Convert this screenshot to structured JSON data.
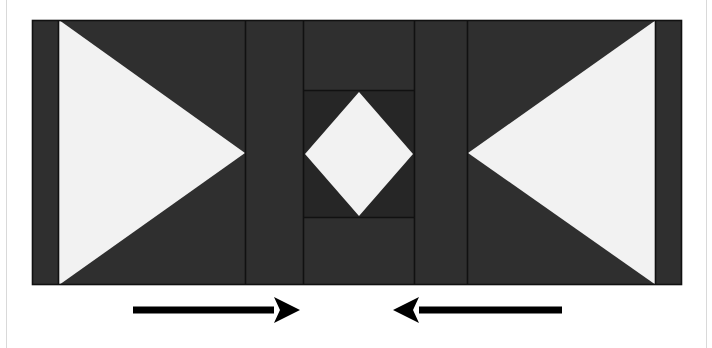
{
  "document": {
    "title": "Pieced Quilt Block Assembly Diagram",
    "description": "Horizontal pieced block: two large white triangles pointing inward flank a central square-in-a-square diamond unit, with two directional assembly arrows beneath."
  },
  "canvas": {
    "width": 712,
    "height": 348,
    "background_color": "#ffffff"
  },
  "palette": {
    "fabric_dark": "#2f2f2f",
    "fabric_dark_center": "#262626",
    "fabric_light": "#f2f2f2",
    "seam_line": "#111111",
    "arrow_color": "#000000",
    "page_rule": "#d9d9d9"
  },
  "block": {
    "name": "pieced-block",
    "left": 32,
    "top": 20,
    "right": 682,
    "bottom": 285,
    "width": 650,
    "height": 265
  },
  "columns": [
    {
      "name": "left-outer-sash",
      "x_start": 32,
      "x_end": 59,
      "fill": "fabric_dark"
    },
    {
      "name": "left-triangle-panel",
      "x_start": 59,
      "x_end": 245,
      "fill": "fabric_dark"
    },
    {
      "name": "left-inner-sash",
      "x_start": 245,
      "x_end": 303,
      "fill": "fabric_dark"
    },
    {
      "name": "center-unit",
      "x_start": 303,
      "x_end": 415,
      "fill": "fabric_dark"
    },
    {
      "name": "right-inner-sash",
      "x_start": 415,
      "x_end": 468,
      "fill": "fabric_dark"
    },
    {
      "name": "right-triangle-panel",
      "x_start": 468,
      "x_end": 656,
      "fill": "fabric_dark"
    },
    {
      "name": "right-outer-sash",
      "x_start": 656,
      "x_end": 682,
      "fill": "fabric_dark"
    }
  ],
  "shapes": {
    "left_triangle": {
      "label": "left white triangle pointing right",
      "points": "59,20 59,285 245,153",
      "fill": "fabric_light"
    },
    "right_triangle": {
      "label": "right white triangle pointing left",
      "points": "656,20 656,285 468,153",
      "fill": "fabric_light"
    },
    "center_box": {
      "label": "center dark square framing the diamond",
      "x": 303,
      "y": 90,
      "width": 112,
      "height": 128,
      "fill": "fabric_dark_center"
    },
    "center_diamond": {
      "label": "white on-point square (diamond) at block center",
      "points": "359,92 413,154 359,216 305,154",
      "fill": "fabric_light"
    }
  },
  "arrows": [
    {
      "name": "arrow-right",
      "direction": "right",
      "label": "press / assemble toward the right",
      "tail_x": 133,
      "tip_x": 300,
      "y": 310,
      "shaft_thickness": 7,
      "head_length": 26,
      "head_half_width": 13
    },
    {
      "name": "arrow-left",
      "direction": "left",
      "label": "press / assemble toward the left",
      "tail_x": 562,
      "tip_x": 393,
      "y": 310,
      "shaft_thickness": 7,
      "head_length": 26,
      "head_half_width": 13
    }
  ],
  "page_rules": [
    {
      "name": "left-page-rule",
      "x": 6,
      "y_start": 0,
      "y_end": 348
    },
    {
      "name": "right-page-rule",
      "x": 706,
      "y_start": 0,
      "y_end": 348
    }
  ],
  "chart_data": {
    "type": "diagram",
    "units": "pixels",
    "segments_horizontal": [
      32,
      59,
      245,
      303,
      415,
      468,
      656,
      682
    ],
    "center_vertical_divisions": [
      20,
      90,
      218,
      285
    ],
    "symmetry": "mirror about vertical axis at x = 357",
    "legend": [
      {
        "swatch": "#2f2f2f",
        "label": "dark fabric"
      },
      {
        "swatch": "#f2f2f2",
        "label": "light fabric"
      }
    ]
  }
}
